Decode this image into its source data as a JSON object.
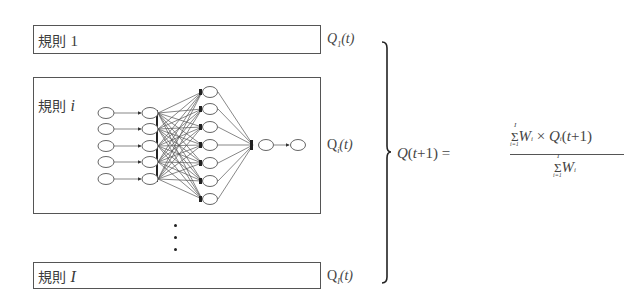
{
  "diagram": {
    "type": "ensemble-of-rules-with-neural-network",
    "rules": [
      {
        "label_prefix": "規則",
        "label_index": "1",
        "output": {
          "symbol": "Q",
          "sub": "1",
          "arg": "(t)"
        }
      },
      {
        "label_prefix": "規則",
        "label_index": "i",
        "output": {
          "symbol": "Q",
          "sub": "i",
          "arg": "(t)"
        }
      },
      {
        "label_prefix": "規則",
        "label_index": "I",
        "output": {
          "symbol": "Q",
          "sub": "I",
          "arg": "(t)"
        }
      }
    ],
    "ellipsis": "⋮",
    "network": {
      "input_nodes": 5,
      "second_layer_nodes": 5,
      "hidden_nodes": 7,
      "output_chain_nodes": 2
    },
    "formula": {
      "lhs": "Q(t+1) =",
      "numerator": "Σ_{i=1}^{I} W_i × Q_i(t+1)",
      "denominator": "Σ_{i=1}^{I} W_i",
      "sum_upper": "I",
      "sum_lower": "i=1",
      "weight": "W",
      "weight_sub": "i",
      "times": "×",
      "q": "Q",
      "q_sub": "i",
      "q_arg": "(t+1)"
    }
  }
}
